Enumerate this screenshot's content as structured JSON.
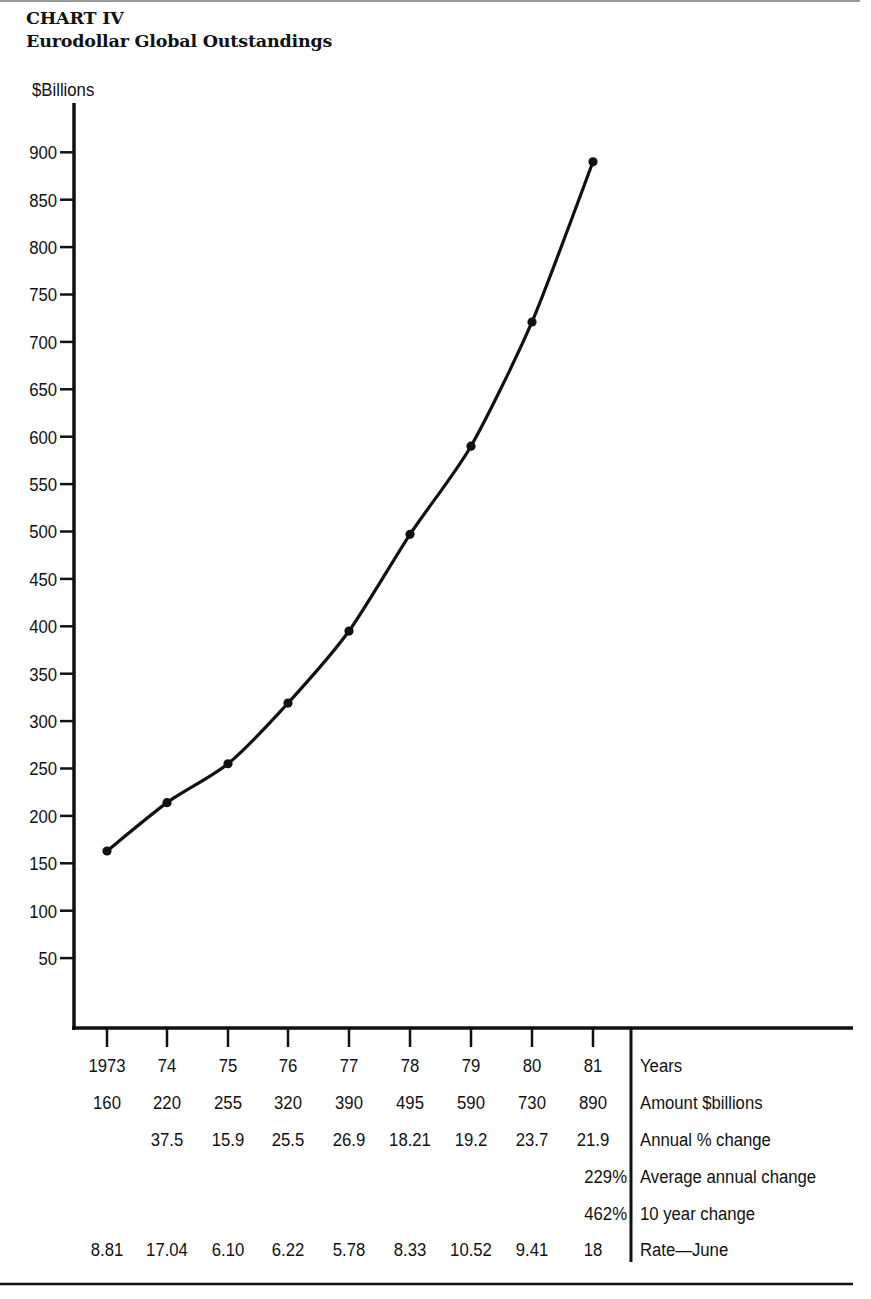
{
  "header": {
    "chart_number": "CHART IV",
    "title": "Eurodollar Global Outstandings"
  },
  "axis": {
    "y_label": "$Billions",
    "y_ticks": [
      "900",
      "850",
      "800",
      "750",
      "700",
      "650",
      "600",
      "550",
      "500",
      "450",
      "400",
      "350",
      "300",
      "250",
      "200",
      "150",
      "100",
      "50"
    ]
  },
  "table": {
    "row_labels": [
      "Years",
      "Amount $billions",
      "Annual % change",
      "Average annual change",
      "10 year change",
      "Rate—June"
    ],
    "years": [
      "1973",
      "74",
      "75",
      "76",
      "77",
      "78",
      "79",
      "80",
      "81"
    ],
    "amounts": [
      "160",
      "220",
      "255",
      "320",
      "390",
      "495",
      "590",
      "730",
      "890"
    ],
    "annual_pct_change": [
      "",
      "37.5",
      "15.9",
      "25.5",
      "26.9",
      "18.21",
      "19.2",
      "23.7",
      "21.9"
    ],
    "average_annual_change": [
      "",
      "",
      "",
      "",
      "",
      "",
      "",
      "",
      "229%"
    ],
    "ten_year_change": [
      "",
      "",
      "",
      "",
      "",
      "",
      "",
      "",
      "462%"
    ],
    "rate_june": [
      "8.81",
      "17.04",
      "6.10",
      "6.22",
      "5.78",
      "8.33",
      "10.52",
      "9.41",
      "18"
    ]
  },
  "chart_data": {
    "type": "line",
    "xlabel": "Years",
    "ylabel": "$Billions",
    "categories": [
      "1973",
      "74",
      "75",
      "76",
      "77",
      "78",
      "79",
      "80",
      "81"
    ],
    "series": [
      {
        "name": "Amount $billions (plotted)",
        "values": [
          163,
          214,
          255,
          319,
          395,
          497,
          590,
          721,
          890
        ]
      }
    ],
    "labeled_values": {
      "Amount $billions": [
        160,
        220,
        255,
        320,
        390,
        495,
        590,
        730,
        890
      ],
      "Annual % change": [
        null,
        37.5,
        15.9,
        25.5,
        26.9,
        18.21,
        19.2,
        23.7,
        21.9
      ],
      "Average annual change": "229%",
      "10 year change": "462%",
      "Rate—June": [
        8.81,
        17.04,
        6.1,
        6.22,
        5.78,
        8.33,
        10.52,
        9.41,
        18
      ]
    },
    "ylim": [
      0,
      950
    ],
    "y_ticks": [
      50,
      100,
      150,
      200,
      250,
      300,
      350,
      400,
      450,
      500,
      550,
      600,
      650,
      700,
      750,
      800,
      850,
      900
    ],
    "grid": false,
    "markers": true,
    "legend": "none"
  }
}
